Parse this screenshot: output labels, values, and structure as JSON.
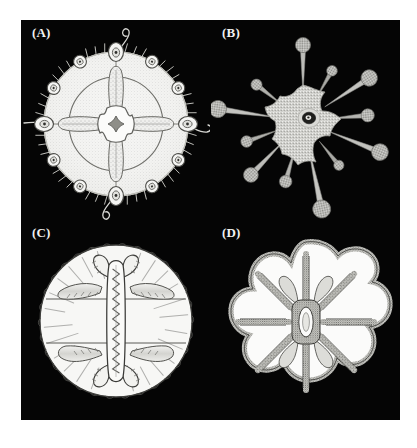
{
  "figure": {
    "background_color": "#ffffff",
    "plate_color": "#050505",
    "label_color": "#f2f2f2",
    "ink_color": "#2b2b2b",
    "fill_color": "#f4f4f4",
    "panel_count": 4,
    "layout": "2x2 grid"
  },
  "panels": [
    {
      "id": "a",
      "label": "(A)",
      "name": "panel-a-radial-medusa",
      "description": "Umbrella-shaped medusa viewed from above with four radial canals forming a cross, a circular ring canal, a four-lobed central manubrium and twelve marginal bulbs bearing tentacles",
      "symmetry": "tetraradial",
      "radial_canals": 4,
      "marginal_bulbs": 12,
      "large_bulbs": 4,
      "small_bulbs": 8,
      "tentacles": 4,
      "ring_canal": true,
      "stipple_fill": true
    },
    {
      "id": "b",
      "label": "(B)",
      "name": "panel-b-stellate-polyp",
      "description": "Star-shaped granular disc with a central ring-shaped mouth and twelve radiating tentacles each ending in a round knobbed capitulum",
      "symmetry": "radial",
      "tentacles": 12,
      "knob_tipped_tentacles": 12,
      "central_mouth": true,
      "stipple_fill": true
    },
    {
      "id": "c",
      "label": "(C)",
      "name": "panel-c-manubrium-medusa",
      "description": "Circular bell seen from below with an elongate vertical manubrium with crenulate margins, four folded gonads and numerous short marginal tentacles around the rim",
      "symmetry": "biradial",
      "gonads": 4,
      "manubrium": "elongate vertical with serrated lips",
      "marginal_tentacles": "numerous short",
      "outline_only": true
    },
    {
      "id": "d",
      "label": "(D)",
      "name": "panel-d-eight-lobed-medusa",
      "description": "Flower-like eight-lobed outline with a central oval stomach, eight thick textured radial canals and a beaded scalloped margin",
      "symmetry": "octoradial",
      "lobes": 8,
      "radial_canals": 8,
      "central_stomach": "oval",
      "margin": "scalloped and beaded"
    }
  ]
}
